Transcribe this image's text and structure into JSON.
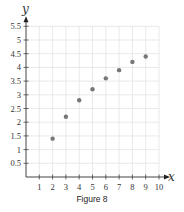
{
  "chart_data": {
    "type": "scatter",
    "title": "",
    "caption": "Figure 8",
    "xlabel": "x",
    "ylabel": "y",
    "x": [
      2,
      3,
      4,
      5,
      6,
      7,
      8,
      9
    ],
    "y": [
      1.4,
      2.2,
      2.8,
      3.2,
      3.6,
      3.9,
      4.2,
      4.4
    ],
    "xlim": [
      0,
      10
    ],
    "ylim": [
      0,
      5.5
    ],
    "x_ticks": [
      "1",
      "2",
      "3",
      "4",
      "5",
      "6",
      "7",
      "8",
      "9",
      "10"
    ],
    "y_ticks": [
      "0.5",
      "1",
      "1.5",
      "2",
      "2.5",
      "3",
      "3.5",
      "4",
      "4.5",
      "5",
      "5.5"
    ],
    "grid": true,
    "legend": null,
    "colors": {
      "point": "#777777",
      "grid": "#e3e3e3",
      "axis": "#444444"
    }
  }
}
